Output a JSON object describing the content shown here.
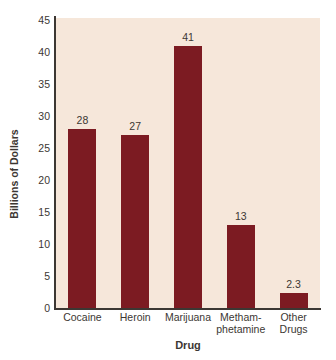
{
  "page": {
    "background": "#ffffff"
  },
  "chart_data": {
    "type": "bar",
    "title": "",
    "categories": [
      "Cocaine",
      "Heroin",
      "Marijuana",
      "Methamphetamine",
      "Other Drugs"
    ],
    "category_label_lines": [
      [
        "Cocaine"
      ],
      [
        "Heroin"
      ],
      [
        "Marijuana"
      ],
      [
        "Metham-",
        "phetamine"
      ],
      [
        "Other",
        "Drugs"
      ]
    ],
    "values": [
      28,
      27,
      41,
      13,
      2.3
    ],
    "value_labels": [
      "28",
      "27",
      "41",
      "13",
      "2.3"
    ],
    "xlabel": "Drug",
    "ylabel": "Billions of Dollars",
    "ylim": [
      0,
      45
    ],
    "yticks": [
      0,
      5,
      10,
      15,
      20,
      25,
      30,
      35,
      40,
      45
    ],
    "grid": false,
    "legend": false,
    "layout": {
      "bar_width_px": 28,
      "plot": {
        "left": 56,
        "top": 18,
        "width": 264,
        "height": 290,
        "baseline_y": 308,
        "y_top": 20
      }
    },
    "colors": {
      "bar": "#7c1b22",
      "plot_background": "#f6e7da",
      "text": "#3c3733",
      "axis": "#3c3733",
      "page_background": "#ffffff"
    }
  }
}
